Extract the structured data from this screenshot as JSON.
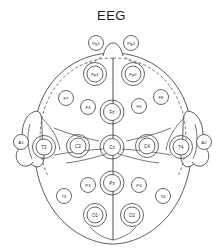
{
  "figure": {
    "title": "EEG",
    "colors": {
      "background": "#ffffff",
      "outline": "#4a4a4a",
      "dashed": "#5a5a5a",
      "label_text": "#2a2a2a",
      "title_text": "#1a1a1a"
    }
  },
  "electrodes": [
    {
      "id": "Pg1",
      "label": "Pg1",
      "cx": 96,
      "cy": 43,
      "r": 7.5,
      "ring": 0,
      "font": 4.2,
      "group": "nasopharyngeal-left"
    },
    {
      "id": "Pg2",
      "label": "Pg2",
      "cx": 131,
      "cy": 43,
      "r": 7.5,
      "ring": 0,
      "font": 4.2,
      "group": "nasopharyngeal-right"
    },
    {
      "id": "Fp1",
      "label": "Fp1",
      "cx": 95,
      "cy": 74,
      "r": 8.0,
      "ring": 11.5,
      "font": 4.4,
      "group": "prefrontal-left"
    },
    {
      "id": "Fp2",
      "label": "Fp2",
      "cx": 133,
      "cy": 74,
      "r": 8.0,
      "ring": 11.5,
      "font": 4.4,
      "group": "prefrontal-right"
    },
    {
      "id": "F7",
      "label": "F7",
      "cx": 66,
      "cy": 98,
      "r": 7.5,
      "ring": 0,
      "font": 4.4,
      "group": "frontal-left-lateral"
    },
    {
      "id": "F3",
      "label": "F3",
      "cx": 88,
      "cy": 107,
      "r": 7.5,
      "ring": 0,
      "font": 4.4,
      "group": "frontal-left"
    },
    {
      "id": "Fz",
      "label": "Fz",
      "cx": 112,
      "cy": 112,
      "r": 8.5,
      "ring": 12.0,
      "font": 4.6,
      "group": "frontal-midline"
    },
    {
      "id": "F4",
      "label": "F4",
      "cx": 139,
      "cy": 106,
      "r": 7.5,
      "ring": 0,
      "font": 4.4,
      "group": "frontal-right"
    },
    {
      "id": "F8",
      "label": "F8",
      "cx": 161,
      "cy": 97,
      "r": 7.5,
      "ring": 0,
      "font": 4.4,
      "group": "frontal-right-lateral"
    },
    {
      "id": "A1",
      "label": "A1",
      "cx": 21,
      "cy": 142,
      "r": 7.5,
      "ring": 0,
      "font": 4.4,
      "group": "ear-reference-left"
    },
    {
      "id": "T3",
      "label": "T3",
      "cx": 44,
      "cy": 147,
      "r": 8.0,
      "ring": 11.5,
      "font": 4.5,
      "group": "temporal-left"
    },
    {
      "id": "C3",
      "label": "C3",
      "cx": 78,
      "cy": 146,
      "r": 8.0,
      "ring": 11.5,
      "font": 4.5,
      "group": "central-left"
    },
    {
      "id": "Cz",
      "label": "Cz",
      "cx": 112,
      "cy": 147,
      "r": 8.5,
      "ring": 12.0,
      "font": 4.6,
      "group": "central-midline"
    },
    {
      "id": "C4",
      "label": "C4",
      "cx": 147,
      "cy": 146,
      "r": 8.0,
      "ring": 11.5,
      "font": 4.5,
      "group": "central-right"
    },
    {
      "id": "T4",
      "label": "T4",
      "cx": 181,
      "cy": 147,
      "r": 8.0,
      "ring": 11.5,
      "font": 4.5,
      "group": "temporal-right"
    },
    {
      "id": "A2",
      "label": "A2",
      "cx": 204,
      "cy": 142,
      "r": 7.5,
      "ring": 0,
      "font": 4.4,
      "group": "ear-reference-right"
    },
    {
      "id": "P3",
      "label": "P3",
      "cx": 88,
      "cy": 185,
      "r": 7.5,
      "ring": 0,
      "font": 4.4,
      "group": "parietal-left"
    },
    {
      "id": "Pz",
      "label": "Pz",
      "cx": 112,
      "cy": 183,
      "r": 8.5,
      "ring": 12.0,
      "font": 4.6,
      "group": "parietal-midline"
    },
    {
      "id": "P4",
      "label": "P4",
      "cx": 139,
      "cy": 185,
      "r": 7.5,
      "ring": 0,
      "font": 4.4,
      "group": "parietal-right"
    },
    {
      "id": "T5",
      "label": "T5",
      "cx": 64,
      "cy": 196,
      "r": 7.5,
      "ring": 0,
      "font": 4.4,
      "group": "temporal-posterior-left"
    },
    {
      "id": "T6",
      "label": "T6",
      "cx": 163,
      "cy": 196,
      "r": 7.5,
      "ring": 0,
      "font": 4.4,
      "group": "temporal-posterior-right"
    },
    {
      "id": "O1",
      "label": "O1",
      "cx": 95,
      "cy": 215,
      "r": 8.0,
      "ring": 11.5,
      "font": 4.5,
      "group": "occipital-left"
    },
    {
      "id": "O2",
      "label": "O2",
      "cx": 132,
      "cy": 215,
      "r": 8.0,
      "ring": 11.5,
      "font": 4.5,
      "group": "occipital-right"
    }
  ]
}
